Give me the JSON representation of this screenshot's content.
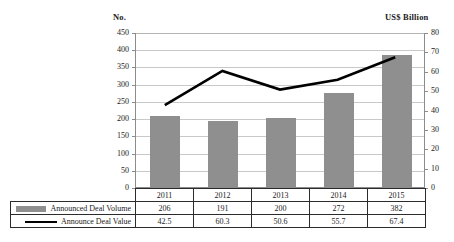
{
  "axis_headers": {
    "left": "No.",
    "right": "US$ Billion"
  },
  "chart_data": {
    "type": "bar",
    "title": "",
    "xlabel": "",
    "categories": [
      "2011",
      "2012",
      "2013",
      "2014",
      "2015"
    ],
    "series": [
      {
        "name": "Announced Deal Volume",
        "type": "bar",
        "axis": "left",
        "color": "#8f8f8f",
        "values": [
          206,
          191,
          200,
          272,
          382
        ]
      },
      {
        "name": "Announce Deal Value",
        "type": "line",
        "axis": "right",
        "color": "#000000",
        "values": [
          42.5,
          60.3,
          50.6,
          55.7,
          67.4
        ]
      }
    ],
    "left_axis": {
      "label": "No.",
      "ylim": [
        0,
        450
      ],
      "ticks": [
        0,
        50,
        100,
        150,
        200,
        250,
        300,
        350,
        400,
        450
      ],
      "tick_labels": [
        "0",
        "50",
        "100",
        "150",
        "200",
        "250",
        "300",
        "350",
        "400",
        "450"
      ]
    },
    "right_axis": {
      "label": "US$ Billion",
      "ylim": [
        0,
        80
      ],
      "ticks": [
        0,
        10,
        20,
        30,
        40,
        50,
        60,
        70,
        80
      ],
      "tick_labels": [
        "0",
        "10",
        "20",
        "30",
        "40",
        "50",
        "60",
        "70",
        "80"
      ]
    },
    "grid": true,
    "legend_position": "table-below"
  },
  "data_table": {
    "year_row": [
      "2011",
      "2012",
      "2013",
      "2014",
      "2015"
    ],
    "rows": [
      {
        "label": "Announced Deal Volume",
        "swatch": "bar-swatch-icon",
        "values": [
          "206",
          "191",
          "200",
          "272",
          "382"
        ]
      },
      {
        "label": "Announce Deal Value",
        "swatch": "line-swatch-icon",
        "values": [
          "42.5",
          "60.3",
          "50.6",
          "55.7",
          "67.4"
        ]
      }
    ]
  }
}
